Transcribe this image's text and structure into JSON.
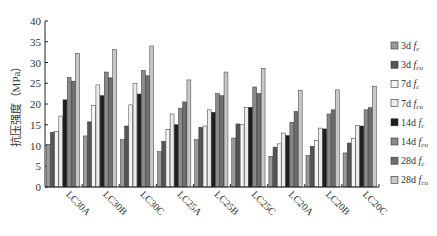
{
  "chart_data": {
    "type": "bar",
    "title": "",
    "xlabel": "",
    "ylabel": "抗压强度（MPa）",
    "ylim": [
      0,
      40
    ],
    "yticks": [
      0,
      5,
      10,
      15,
      20,
      25,
      30,
      35,
      40
    ],
    "grid": false,
    "legend_position": "right",
    "categories": [
      "LC30A",
      "LC30B",
      "LC30C",
      "LC25A",
      "LC25B",
      "LC25C",
      "LC20A",
      "LC20B",
      "LC20C"
    ],
    "series": [
      {
        "name": "3d f_c",
        "label_main": "3d ",
        "label_f": "f",
        "label_sub": "c",
        "color": "#9a9a9a",
        "values": [
          10.3,
          12.3,
          11.4,
          8.5,
          11.4,
          11.8,
          7.4,
          7.6,
          8.2
        ]
      },
      {
        "name": "3d f_cu",
        "label_main": "3d ",
        "label_f": "f",
        "label_sub": "cu",
        "color": "#555555",
        "values": [
          13.2,
          15.7,
          14.7,
          11.0,
          14.4,
          15.2,
          9.6,
          9.8,
          10.6
        ]
      },
      {
        "name": "7d f_c",
        "label_main": "7d ",
        "label_f": "f",
        "label_sub": "c",
        "color": "#f4f4f4",
        "values": [
          13.4,
          19.6,
          19.8,
          13.8,
          14.7,
          15.0,
          10.4,
          11.2,
          11.7
        ]
      },
      {
        "name": "7d f_cu",
        "label_main": "7d ",
        "label_f": "f",
        "label_sub": "cu",
        "color": "#ececec",
        "values": [
          17.1,
          24.6,
          24.9,
          17.6,
          18.6,
          19.1,
          13.0,
          14.2,
          14.8
        ]
      },
      {
        "name": "14d f_c",
        "label_main": "14d ",
        "label_f": "f",
        "label_sub": "c",
        "color": "#1e1e1e",
        "values": [
          21.0,
          22.0,
          22.4,
          15.0,
          18.0,
          19.2,
          12.4,
          14.0,
          14.7
        ]
      },
      {
        "name": "14d f_cu",
        "label_main": "14d ",
        "label_f": "f",
        "label_sub": "cu",
        "color": "#8a8a8a",
        "values": [
          26.4,
          27.7,
          28.1,
          19.0,
          22.5,
          24.1,
          15.6,
          17.6,
          18.6
        ]
      },
      {
        "name": "28d f_c",
        "label_main": "28d ",
        "label_f": "f",
        "label_sub": "c",
        "color": "#6e6e6e",
        "values": [
          25.5,
          26.3,
          26.8,
          20.5,
          22.0,
          22.5,
          18.2,
          18.6,
          19.1
        ]
      },
      {
        "name": "28d f_cu",
        "label_main": "28d ",
        "label_f": "f",
        "label_sub": "cu",
        "color": "#c8c8c8",
        "values": [
          32.2,
          33.1,
          34.0,
          25.8,
          27.7,
          28.6,
          23.3,
          23.4,
          24.3
        ]
      }
    ]
  }
}
